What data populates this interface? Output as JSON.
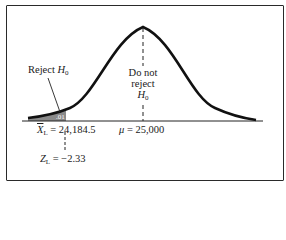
{
  "figure": {
    "reject_label": "Reject",
    "reject_symbol": "H",
    "reject_sub": "0",
    "do_not_reject": [
      "Do not",
      "reject"
    ],
    "do_not_reject_symbol": "H",
    "do_not_reject_sub": "0",
    "area_label": ".01",
    "critical_value_symbol": "X",
    "critical_value_sub": "L",
    "critical_value_text": "= 24,184.5",
    "mean_symbol": "μ",
    "mean_text": "= 25,000",
    "z_symbol": "Z",
    "z_sub": "L",
    "z_text": "= −2.33"
  },
  "colors": {
    "curve": "#111111",
    "shade": "#8a8a8a",
    "frame": "#2a2a2a"
  }
}
